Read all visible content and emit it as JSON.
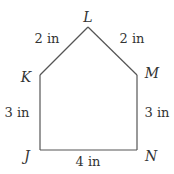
{
  "diagram": {
    "shape": "pentagon",
    "vertices": [
      {
        "label": "L",
        "x": 88,
        "y": 27
      },
      {
        "label": "M",
        "x": 137,
        "y": 75
      },
      {
        "label": "N",
        "x": 137,
        "y": 150
      },
      {
        "label": "J",
        "x": 40,
        "y": 150
      },
      {
        "label": "K",
        "x": 40,
        "y": 75
      }
    ],
    "edges": [
      {
        "from": "K",
        "to": "L",
        "length": "2 in"
      },
      {
        "from": "L",
        "to": "M",
        "length": "2 in"
      },
      {
        "from": "M",
        "to": "N",
        "length": "3 in"
      },
      {
        "from": "J",
        "to": "N",
        "length": "4 in"
      },
      {
        "from": "K",
        "to": "J",
        "length": "3 in"
      }
    ],
    "labels": {
      "vertex_L": "L",
      "vertex_K": "K",
      "vertex_M": "M",
      "vertex_J": "J",
      "vertex_N": "N",
      "edge_KL": "2 in",
      "edge_LM": "2 in",
      "edge_KJ": "3 in",
      "edge_MN": "3 in",
      "edge_JN": "4 in"
    },
    "colors": {
      "stroke": "#555555",
      "text": "#333333",
      "background": "#ffffff"
    }
  }
}
